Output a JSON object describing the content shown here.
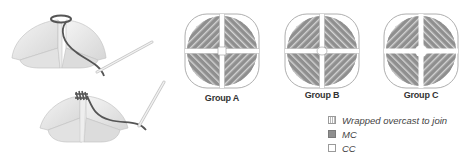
{
  "illustrations": {
    "top": {
      "name": "join-step-1",
      "description": "overcast wrapping around center of folded squares"
    },
    "bottom": {
      "name": "join-step-2",
      "description": "wrapped center gathered with needle"
    }
  },
  "groups": [
    {
      "label": "Group A"
    },
    {
      "label": "Group B"
    },
    {
      "label": "Group C"
    }
  ],
  "legend": {
    "items": [
      {
        "key": "wrapped",
        "label": "Wrapped overcast to join"
      },
      {
        "key": "mc",
        "label": "MC"
      },
      {
        "key": "cc",
        "label": "CC"
      }
    ]
  },
  "colors": {
    "mc": "#8f8f8f",
    "cc": "#ffffff",
    "outline": "#9a9a9a",
    "yarn": "#555555"
  }
}
